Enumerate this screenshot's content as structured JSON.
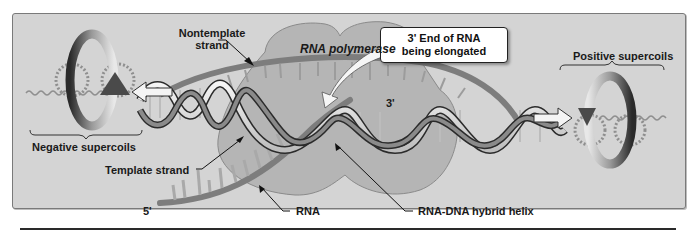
{
  "figure": {
    "colors": {
      "panel_bg": "#d4d4d4",
      "panel_border": "#7a7a7a",
      "polymerase_fill": "#b8b8b8",
      "rna_strand": "#7d7d7d",
      "dna_ribbon_light": "#efefef",
      "dna_ribbon_dark": "#6e6e6e",
      "arrow_white": "#f4f4f4",
      "label_text": "#1a1a1a"
    }
  },
  "labels": {
    "nontemplate_strand": "Nontemplate\nstrand",
    "nontemplate_line1": "Nontemplate",
    "nontemplate_line2": "strand",
    "rna_polymerase": "RNA polymerase",
    "three_prime_end_line1": "3' End of RNA",
    "three_prime_end_line2": "being elongated",
    "positive_supercoils": "Positive supercoils",
    "negative_supercoils": "Negative supercoils",
    "template_strand": "Template strand",
    "rna": "RNA",
    "rna_dna_hybrid_helix": "RNA-DNA hybrid helix",
    "five_prime": "5'",
    "three_prime": "3'"
  }
}
